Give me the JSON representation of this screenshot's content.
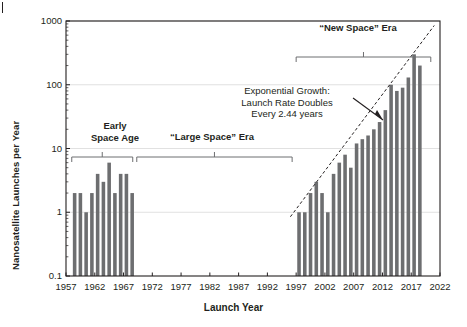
{
  "chart_data": {
    "type": "bar",
    "title": "",
    "xlabel": "Launch Year",
    "ylabel": "Nanosatellite Launches per Year",
    "xlim": [
      1957,
      2022
    ],
    "ylim": [
      0.1,
      1000
    ],
    "yscale": "log",
    "grid": true,
    "legend_position": "none",
    "ytick_labels": [
      "1000",
      "100",
      "10",
      "1",
      "0.1"
    ],
    "ytick_values": [
      1000,
      100,
      10,
      1,
      0.1
    ],
    "xtick_labels": [
      "1957",
      "1962",
      "1967",
      "1972",
      "1977",
      "1982",
      "1987",
      "1992",
      "1997",
      "2002",
      "2007",
      "2012",
      "2017",
      "2022"
    ],
    "xtick_values": [
      1957,
      1962,
      1967,
      1972,
      1977,
      1982,
      1987,
      1992,
      1997,
      2002,
      2007,
      2012,
      2017,
      2022
    ],
    "bar_color": "#6d6e70",
    "categories": [
      1958,
      1959,
      1960,
      1961,
      1962,
      1963,
      1964,
      1965,
      1966,
      1967,
      1968,
      1997,
      1998,
      1999,
      2000,
      2001,
      2002,
      2003,
      2004,
      2005,
      2006,
      2007,
      2008,
      2009,
      2010,
      2011,
      2012,
      2013,
      2014,
      2015,
      2016,
      2017,
      2018
    ],
    "values": [
      2,
      2,
      1,
      2,
      4,
      3,
      6,
      2,
      4,
      4,
      2,
      1,
      1,
      2,
      3,
      2,
      1,
      4,
      6,
      8,
      5,
      12,
      14,
      16,
      20,
      26,
      40,
      100,
      80,
      90,
      130,
      300,
      200
    ],
    "annotations": [
      {
        "name": "exponential-growth-note",
        "text": "Exponential Growth:\nLaunch Rate Doubles\nEvery 2.44 years"
      },
      {
        "name": "early-space-age-era",
        "text": "Early\nSpace Age",
        "span": [
          1958,
          1968
        ]
      },
      {
        "name": "large-space-era",
        "text": "“Large Space” Era",
        "span": [
          1969,
          1996
        ]
      },
      {
        "name": "new-space-era",
        "text": "“New Space” Era",
        "span": [
          1997,
          2020
        ]
      }
    ],
    "trendline": {
      "name": "exponential-trendline",
      "style": "dashed",
      "doubling_time_years": 2.44,
      "x_start": 1996,
      "y_start": 0.85,
      "x_end": 2021,
      "y_end": 850
    }
  }
}
